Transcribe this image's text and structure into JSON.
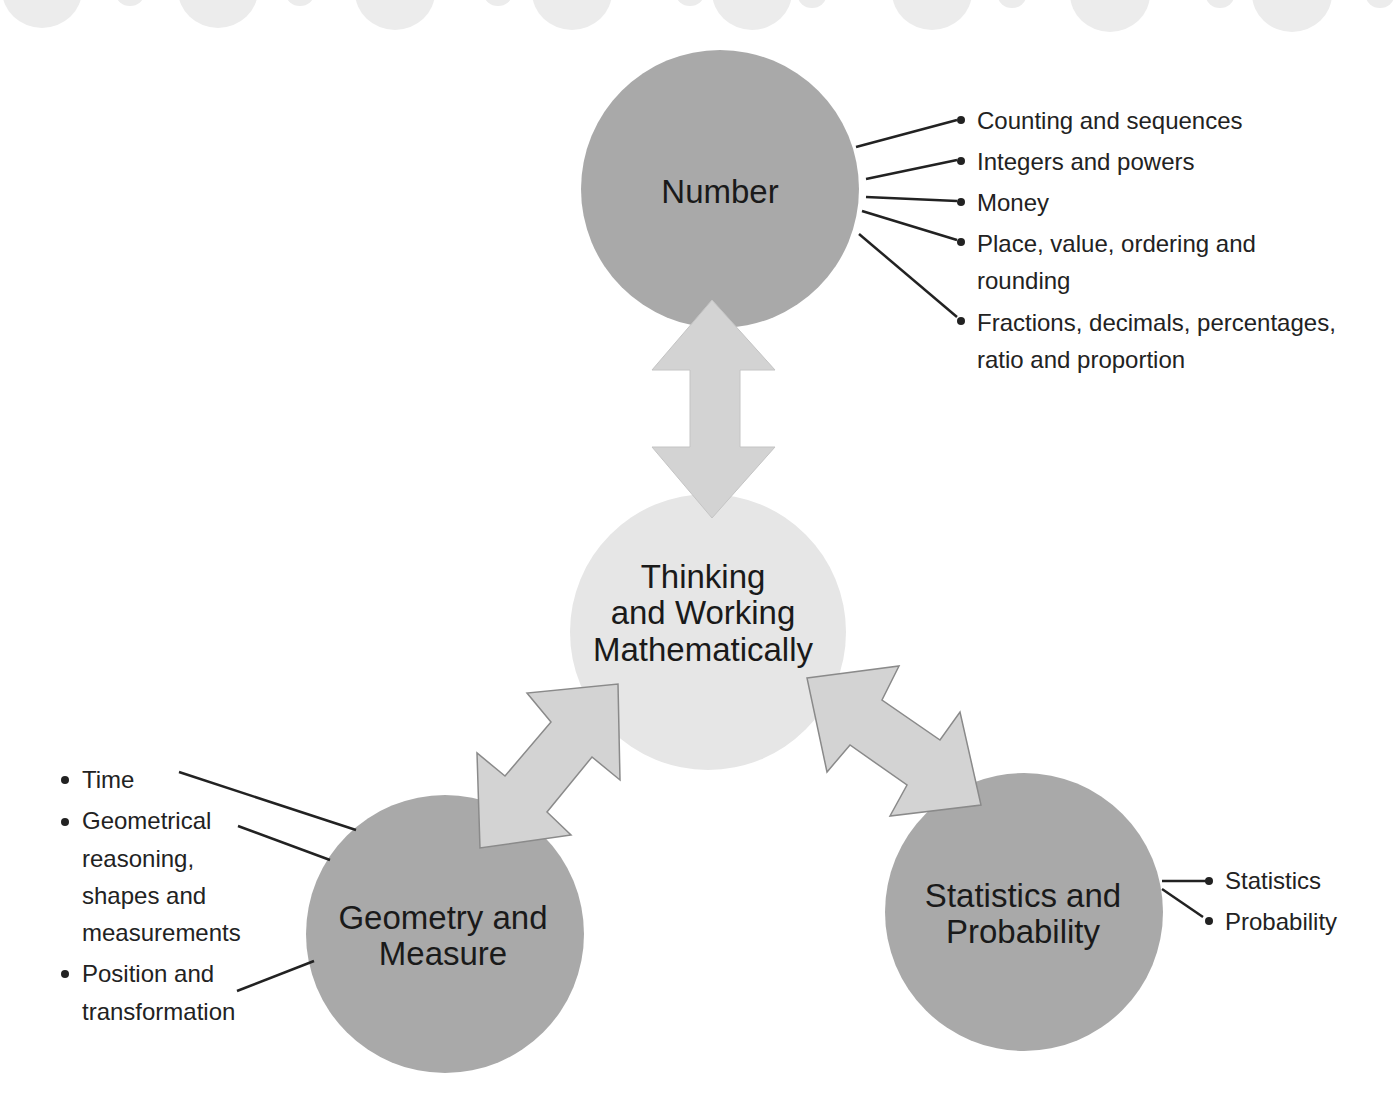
{
  "diagram": {
    "colors": {
      "domain_circle": "#a9a9a9",
      "center_circle": "#e6e6e6",
      "arrow_fill": "#d3d3d3",
      "arrow_stroke": "#8a8a8a",
      "connector_line": "#222222",
      "decor_blob": "#ececec"
    },
    "center": {
      "line1": "Thinking",
      "line2": "and Working",
      "line3": "Mathematically"
    },
    "number": {
      "title": "Number",
      "items": [
        "Counting and sequences",
        "Integers and powers",
        "Money",
        "Place, value, ordering and",
        "rounding",
        "Fractions, decimals, percentages,",
        "ratio and proportion"
      ]
    },
    "geometry": {
      "line1": "Geometry and",
      "line2": "Measure",
      "items": [
        "Time",
        "Geometrical",
        "reasoning,",
        "shapes and",
        "measurements",
        "Position and",
        "transformation"
      ]
    },
    "statistics": {
      "line1": "Statistics and",
      "line2": "Probability",
      "items": [
        "Statistics",
        "Probability"
      ]
    }
  }
}
